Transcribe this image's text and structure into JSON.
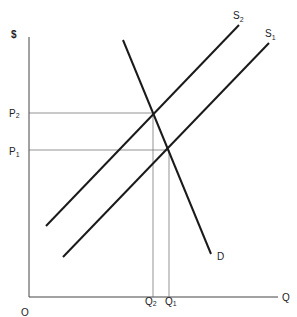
{
  "diagram": {
    "type": "supply-demand",
    "axes": {
      "y_label": "$",
      "x_label": "Q",
      "origin_label": "O"
    },
    "curves": [
      {
        "name": "S2",
        "label": "S",
        "subscript": "2",
        "kind": "supply"
      },
      {
        "name": "S1",
        "label": "S",
        "subscript": "1",
        "kind": "supply"
      },
      {
        "name": "D",
        "label": "D",
        "kind": "demand"
      }
    ],
    "price_levels": [
      {
        "label": "P",
        "subscript": "2"
      },
      {
        "label": "P",
        "subscript": "1"
      }
    ],
    "quantity_levels": [
      {
        "label": "Q",
        "subscript": "2"
      },
      {
        "label": "Q",
        "subscript": "1"
      }
    ],
    "colors": {
      "curve": "#1a1a1a",
      "guide": "#555555",
      "axis": "#444444"
    }
  }
}
